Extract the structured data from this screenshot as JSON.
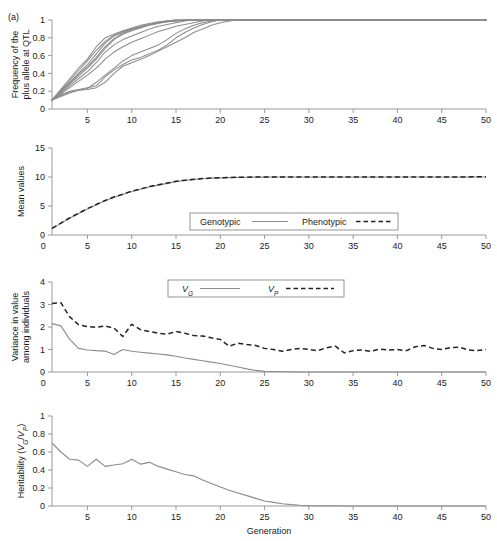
{
  "figure": {
    "panel_letter": "(a)",
    "xlabel": "Generation"
  },
  "chart_data": [
    {
      "id": "panel_a",
      "type": "line",
      "title": "",
      "ylabel": "Frequency of the plus allele at QTL",
      "ylabel_line1": "Frequency of the",
      "ylabel_line2": "plus allele at QTL",
      "xlabel": "",
      "xlim": [
        1,
        50
      ],
      "ylim": [
        0,
        1
      ],
      "yticks": [
        "0",
        "0.2",
        "0.4",
        "0.6",
        "0.8",
        "1"
      ],
      "ytick_values": [
        0,
        0.2,
        0.4,
        0.6,
        0.8,
        1
      ],
      "xticks": [
        "5",
        "10",
        "15",
        "20",
        "25",
        "30",
        "35",
        "40",
        "45",
        "50"
      ],
      "xtick_values": [
        5,
        10,
        15,
        20,
        25,
        30,
        35,
        40,
        45,
        50
      ],
      "grid": false,
      "legend": null,
      "description": "Ten replicate simulation runs of plus-allele frequency rising from 0.1 to fixation at 1.0",
      "x": [
        1,
        2,
        3,
        4,
        5,
        6,
        7,
        8,
        9,
        10,
        11,
        12,
        13,
        14,
        15,
        16,
        17,
        18,
        19,
        20,
        21,
        22,
        23,
        24,
        25,
        30,
        35,
        40,
        45,
        50
      ],
      "series": [
        {
          "name": "run1",
          "values": [
            0.1,
            0.2,
            0.3,
            0.4,
            0.5,
            0.62,
            0.74,
            0.82,
            0.86,
            0.9,
            0.93,
            0.95,
            0.97,
            0.98,
            0.99,
            0.995,
            1,
            1,
            1,
            1,
            1,
            1,
            1,
            1,
            1,
            1,
            1,
            1,
            1,
            1
          ]
        },
        {
          "name": "run2",
          "values": [
            0.1,
            0.19,
            0.28,
            0.37,
            0.46,
            0.56,
            0.68,
            0.78,
            0.84,
            0.88,
            0.91,
            0.94,
            0.96,
            0.98,
            0.99,
            1,
            1,
            1,
            1,
            1,
            1,
            1,
            1,
            1,
            1,
            1,
            1,
            1,
            1,
            1
          ]
        },
        {
          "name": "run3",
          "values": [
            0.1,
            0.21,
            0.32,
            0.43,
            0.54,
            0.66,
            0.76,
            0.83,
            0.87,
            0.9,
            0.92,
            0.95,
            0.97,
            0.99,
            1,
            1,
            1,
            1,
            1,
            1,
            1,
            1,
            1,
            1,
            1,
            1,
            1,
            1,
            1,
            1
          ]
        },
        {
          "name": "run4",
          "values": [
            0.1,
            0.18,
            0.26,
            0.34,
            0.42,
            0.52,
            0.64,
            0.72,
            0.78,
            0.82,
            0.86,
            0.9,
            0.93,
            0.95,
            0.97,
            0.99,
            1,
            1,
            1,
            1,
            1,
            1,
            1,
            1,
            1,
            1,
            1,
            1,
            1,
            1
          ]
        },
        {
          "name": "run5",
          "values": [
            0.1,
            0.22,
            0.34,
            0.46,
            0.56,
            0.7,
            0.8,
            0.84,
            0.88,
            0.91,
            0.94,
            0.96,
            0.98,
            0.99,
            1,
            1,
            1,
            1,
            1,
            1,
            1,
            1,
            1,
            1,
            1,
            1,
            1,
            1,
            1,
            1
          ]
        },
        {
          "name": "run6",
          "values": [
            0.1,
            0.17,
            0.24,
            0.31,
            0.38,
            0.46,
            0.56,
            0.64,
            0.7,
            0.75,
            0.79,
            0.83,
            0.87,
            0.9,
            0.93,
            0.95,
            0.97,
            0.99,
            1,
            1,
            1,
            1,
            1,
            1,
            1,
            1,
            1,
            1,
            1,
            1
          ]
        },
        {
          "name": "run7",
          "values": [
            0.1,
            0.16,
            0.2,
            0.22,
            0.24,
            0.26,
            0.36,
            0.44,
            0.5,
            0.55,
            0.58,
            0.62,
            0.66,
            0.72,
            0.8,
            0.86,
            0.91,
            0.95,
            0.98,
            1,
            1,
            1,
            1,
            1,
            1,
            1,
            1,
            1,
            1,
            1
          ]
        },
        {
          "name": "run8",
          "values": [
            0.1,
            0.15,
            0.19,
            0.21,
            0.23,
            0.3,
            0.38,
            0.46,
            0.54,
            0.6,
            0.64,
            0.68,
            0.72,
            0.78,
            0.85,
            0.9,
            0.94,
            0.97,
            0.99,
            1,
            1,
            1,
            1,
            1,
            1,
            1,
            1,
            1,
            1,
            1
          ]
        },
        {
          "name": "run9",
          "values": [
            0.1,
            0.2,
            0.29,
            0.39,
            0.48,
            0.58,
            0.7,
            0.79,
            0.85,
            0.89,
            0.92,
            0.95,
            0.97,
            0.98,
            0.99,
            1,
            1,
            1,
            1,
            1,
            1,
            1,
            1,
            1,
            1,
            1,
            1,
            1,
            1,
            1
          ]
        },
        {
          "name": "run10",
          "values": [
            0.1,
            0.14,
            0.18,
            0.21,
            0.22,
            0.24,
            0.3,
            0.4,
            0.48,
            0.52,
            0.56,
            0.6,
            0.65,
            0.7,
            0.75,
            0.8,
            0.86,
            0.9,
            0.94,
            0.97,
            0.99,
            1,
            1,
            1,
            1,
            1,
            1,
            1,
            1,
            1
          ]
        }
      ]
    },
    {
      "id": "panel_b",
      "type": "line",
      "ylabel": "Mean values",
      "xlim": [
        1,
        50
      ],
      "ylim": [
        0,
        15
      ],
      "yticks": [
        "0",
        "5",
        "10",
        "15"
      ],
      "ytick_values": [
        0,
        5,
        10,
        15
      ],
      "xticks": [
        "0",
        "5",
        "10",
        "15",
        "20",
        "25",
        "30",
        "35",
        "40",
        "45",
        "50"
      ],
      "xtick_values": [
        0,
        5,
        10,
        15,
        20,
        25,
        30,
        35,
        40,
        45,
        50
      ],
      "grid": false,
      "legend": {
        "position": "inside-bottom-center",
        "entries": [
          {
            "label": "Genotypic",
            "style": "solid"
          },
          {
            "label": "Phenotypic",
            "style": "dashed"
          }
        ]
      },
      "x": [
        1,
        2,
        3,
        4,
        5,
        6,
        7,
        8,
        9,
        10,
        11,
        12,
        13,
        14,
        15,
        16,
        17,
        18,
        19,
        20,
        21,
        22,
        23,
        24,
        25,
        26,
        27,
        28,
        29,
        30,
        32,
        34,
        36,
        38,
        40,
        42,
        44,
        46,
        48,
        50
      ],
      "series": [
        {
          "name": "Genotypic",
          "style": "solid",
          "values": [
            1.1,
            2.0,
            2.9,
            3.7,
            4.5,
            5.2,
            5.9,
            6.5,
            7.0,
            7.5,
            7.9,
            8.3,
            8.6,
            8.9,
            9.2,
            9.4,
            9.55,
            9.7,
            9.8,
            9.85,
            9.9,
            9.93,
            9.95,
            9.97,
            9.98,
            9.99,
            10.0,
            10.0,
            10.0,
            10.0,
            10.0,
            10.0,
            10.0,
            10.0,
            10.0,
            10.0,
            10.0,
            10.0,
            10.0,
            10.0
          ]
        },
        {
          "name": "Phenotypic",
          "style": "dashed",
          "values": [
            1.15,
            2.05,
            2.95,
            3.75,
            4.55,
            5.25,
            5.95,
            6.55,
            7.05,
            7.55,
            7.95,
            8.35,
            8.65,
            8.95,
            9.25,
            9.45,
            9.6,
            9.72,
            9.82,
            9.88,
            9.92,
            9.95,
            9.97,
            9.99,
            10.0,
            10.0,
            10.02,
            10.0,
            10.01,
            10.0,
            10.02,
            10.0,
            10.01,
            10.0,
            10.02,
            10.0,
            10.01,
            10.0,
            10.01,
            10.05
          ]
        }
      ]
    },
    {
      "id": "panel_c",
      "type": "line",
      "ylabel": "Variance in value among individuals",
      "ylabel_line1": "Variance in value",
      "ylabel_line2": "among individuals",
      "xlim": [
        1,
        50
      ],
      "ylim": [
        0,
        4
      ],
      "yticks": [
        "0",
        "1",
        "2",
        "3",
        "4"
      ],
      "ytick_values": [
        0,
        1,
        2,
        3,
        4
      ],
      "xticks": [
        "0",
        "5",
        "10",
        "15",
        "20",
        "25",
        "30",
        "35",
        "40",
        "45",
        "50"
      ],
      "xtick_values": [
        0,
        5,
        10,
        15,
        20,
        25,
        30,
        35,
        40,
        45,
        50
      ],
      "grid": false,
      "legend": {
        "position": "inside-top-center",
        "entries": [
          {
            "label": "VG",
            "label_main": "V",
            "label_sub": "G",
            "style": "solid"
          },
          {
            "label": "VP",
            "label_main": "V",
            "label_sub": "P",
            "style": "dashed"
          }
        ]
      },
      "x": [
        1,
        2,
        3,
        4,
        5,
        6,
        7,
        8,
        9,
        10,
        11,
        12,
        13,
        14,
        15,
        16,
        17,
        18,
        19,
        20,
        21,
        22,
        23,
        24,
        25,
        26,
        27,
        28,
        29,
        30,
        31,
        32,
        33,
        34,
        35,
        36,
        37,
        38,
        39,
        40,
        41,
        42,
        43,
        44,
        45,
        46,
        47,
        48,
        49,
        50
      ],
      "series": [
        {
          "name": "VG",
          "style": "solid",
          "values": [
            2.15,
            2.05,
            1.45,
            1.05,
            0.98,
            0.95,
            0.93,
            0.78,
            1.0,
            0.92,
            0.88,
            0.84,
            0.8,
            0.76,
            0.7,
            0.62,
            0.56,
            0.5,
            0.44,
            0.38,
            0.3,
            0.22,
            0.14,
            0.07,
            0.03,
            0.02,
            0.01,
            0.01,
            0.0,
            0.0,
            0.0,
            0.0,
            0.0,
            0.0,
            0.0,
            0.0,
            0.0,
            0.0,
            0.0,
            0.0,
            0.0,
            0.0,
            0.0,
            0.0,
            0.0,
            0.0,
            0.0,
            0.0,
            0.0,
            0.0
          ]
        },
        {
          "name": "VP",
          "style": "dashed",
          "values": [
            3.05,
            3.08,
            2.45,
            2.1,
            2.02,
            1.98,
            2.05,
            1.95,
            1.58,
            2.12,
            1.88,
            1.8,
            1.72,
            1.68,
            1.8,
            1.72,
            1.62,
            1.6,
            1.52,
            1.45,
            1.15,
            1.28,
            1.22,
            1.18,
            1.05,
            1.0,
            0.92,
            1.0,
            1.05,
            1.0,
            0.95,
            1.08,
            1.15,
            0.85,
            0.95,
            0.98,
            0.92,
            1.02,
            0.98,
            1.0,
            0.95,
            1.12,
            1.18,
            1.05,
            1.0,
            1.08,
            1.1,
            0.98,
            0.95,
            1.0
          ]
        }
      ]
    },
    {
      "id": "panel_d",
      "type": "line",
      "ylabel": "Heritability (VG/VP)",
      "ylabel_main": "Heritability (",
      "ylabel_v1": "V",
      "ylabel_s1": "G",
      "ylabel_mid": "/",
      "ylabel_v2": "V",
      "ylabel_s2": "P",
      "ylabel_end": ")",
      "xlabel": "Generation",
      "xlim": [
        1,
        50
      ],
      "ylim": [
        0,
        1
      ],
      "yticks": [
        "0",
        "0.2",
        "0.4",
        "0.6",
        "0.8",
        "1"
      ],
      "ytick_values": [
        0,
        0.2,
        0.4,
        0.6,
        0.8,
        1
      ],
      "xticks": [
        "5",
        "10",
        "15",
        "20",
        "25",
        "30",
        "35",
        "40",
        "45",
        "50"
      ],
      "xtick_values": [
        5,
        10,
        15,
        20,
        25,
        30,
        35,
        40,
        45,
        50
      ],
      "grid": false,
      "legend": null,
      "x": [
        1,
        2,
        3,
        4,
        5,
        6,
        7,
        8,
        9,
        10,
        11,
        12,
        13,
        14,
        15,
        16,
        17,
        18,
        19,
        20,
        21,
        22,
        23,
        24,
        25,
        26,
        27,
        28,
        29,
        30,
        35,
        40,
        45,
        50
      ],
      "series": [
        {
          "name": "Heritability",
          "style": "solid",
          "values": [
            0.7,
            0.6,
            0.52,
            0.51,
            0.44,
            0.52,
            0.44,
            0.455,
            0.47,
            0.52,
            0.465,
            0.485,
            0.44,
            0.41,
            0.38,
            0.35,
            0.335,
            0.29,
            0.25,
            0.21,
            0.175,
            0.145,
            0.115,
            0.085,
            0.055,
            0.04,
            0.025,
            0.015,
            0.008,
            0.004,
            0.0,
            0.0,
            0.0,
            0.0
          ]
        }
      ]
    }
  ]
}
